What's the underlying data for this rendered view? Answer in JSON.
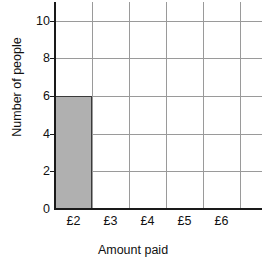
{
  "chart_data": {
    "type": "bar",
    "title": "",
    "subtitle": "",
    "xlabel": "Amount paid",
    "ylabel": "Number of people",
    "categories": [
      "£2",
      "£3",
      "£4",
      "£5",
      "£6"
    ],
    "values": [
      6,
      0,
      0,
      0,
      0
    ],
    "ylim": [
      0,
      11
    ],
    "y_ticks": [
      0,
      2,
      4,
      6,
      8,
      10
    ],
    "y_tick_labels": [
      "0",
      "2",
      "4",
      "6",
      "8",
      "10"
    ],
    "x_tick_labels": [
      "£2",
      "£3",
      "£4",
      "£5",
      "£6"
    ],
    "grid": true,
    "legend": false,
    "legend_position": "none",
    "annotations": [],
    "colors": {
      "bar_fill": "#b0b0b0",
      "bar_border": "#3a3a3a",
      "gridline": "#9a9a9a",
      "axis": "#1a1a1a",
      "text": "#111111",
      "background": "#ffffff"
    }
  },
  "axes": {
    "x_title": "Amount paid",
    "y_title": "Number of people"
  }
}
